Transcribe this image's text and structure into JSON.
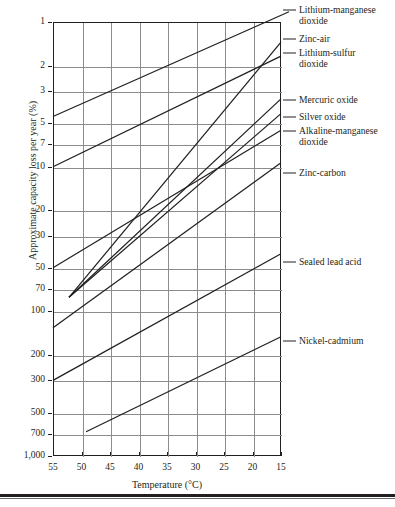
{
  "chart_data": {
    "type": "line",
    "title": "",
    "xlabel": "Temperature (°C)",
    "ylabel": "Approximate capacity loss per year (%)",
    "xticks": [
      55,
      50,
      45,
      40,
      35,
      30,
      25,
      20,
      15
    ],
    "xtick_labels": [
      "55",
      "50",
      "45",
      "40",
      "35",
      "30",
      "25",
      "20",
      "15"
    ],
    "xlim": [
      55,
      15
    ],
    "x_axis_reversed": true,
    "yticks": [
      1,
      2,
      3,
      5,
      7,
      10,
      20,
      30,
      50,
      70,
      100,
      200,
      300,
      500,
      700,
      1000
    ],
    "ytick_labels": [
      "1",
      "2",
      "3",
      "5",
      "7",
      "10",
      "20",
      "30",
      "50",
      "70",
      "100",
      "200",
      "300",
      "500",
      "700",
      "1,000"
    ],
    "ylim": [
      1,
      1000
    ],
    "y_scale": "log",
    "y_axis_inverted": true,
    "grid": true,
    "legend_position": "right-annotations",
    "series": [
      {
        "name": "Lithium-manganese dioxide",
        "label": "Lithium-manganese\ndioxide",
        "points": [
          [
            55,
            4.5
          ],
          [
            13.6,
            0.85
          ]
        ]
      },
      {
        "name": "Zinc-air",
        "label": "Zinc-air",
        "points": [
          [
            52.2,
            80
          ],
          [
            15,
            1.38
          ]
        ]
      },
      {
        "name": "Lithium-sulfur dioxide",
        "label": "Lithium-sulfur\ndioxide",
        "points": [
          [
            55,
            10
          ],
          [
            15,
            1.72
          ]
        ]
      },
      {
        "name": "Mercuric oxide",
        "label": "Mercuric oxide",
        "points": [
          [
            52.2,
            80
          ],
          [
            15,
            3.4
          ]
        ]
      },
      {
        "name": "Silver oxide",
        "label": "Silver oxide",
        "points": [
          [
            52.2,
            80
          ],
          [
            15,
            4.3
          ]
        ]
      },
      {
        "name": "Alkaline-manganese dioxide",
        "label": "Alkaline-manganese\ndioxide",
        "points": [
          [
            55,
            50
          ],
          [
            15,
            5.6
          ]
        ]
      },
      {
        "name": "Zinc-carbon",
        "label": "Zinc-carbon",
        "points": [
          [
            55,
            130
          ],
          [
            15,
            9.4
          ]
        ]
      },
      {
        "name": "Sealed lead acid",
        "label": "Sealed lead acid",
        "points": [
          [
            55,
            300
          ],
          [
            15,
            40
          ]
        ]
      },
      {
        "name": "Nickel-cadmium",
        "label": "Nickel-cadmium",
        "points": [
          [
            49.2,
            680
          ],
          [
            15,
            150
          ]
        ]
      }
    ],
    "annotations": [
      {
        "name": "Lithium-manganese dioxide",
        "text": "Lithium-manganese\ndioxide",
        "y": 10
      },
      {
        "name": "Zinc-air",
        "text": "Zinc-air",
        "y": 39
      },
      {
        "name": "Lithium-sulfur dioxide",
        "text": "Lithium-sulfur\ndioxide",
        "y": 53
      },
      {
        "name": "Mercuric oxide",
        "text": "Mercuric oxide",
        "y": 100
      },
      {
        "name": "Silver oxide",
        "text": "Silver oxide",
        "y": 117
      },
      {
        "name": "Alkaline-manganese dioxide",
        "text": "Alkaline-manganese\ndioxide",
        "y": 131
      },
      {
        "name": "Zinc-carbon",
        "text": "Zinc-carbon",
        "y": 173
      },
      {
        "name": "Sealed lead acid",
        "text": "Sealed lead acid",
        "y": 262
      },
      {
        "name": "Nickel-cadmium",
        "text": "Nickel-cadmium",
        "y": 341
      }
    ],
    "colors": {
      "line": "#231f20",
      "grid": "#8c8c8c",
      "axis": "#231f20",
      "text": "#231f20",
      "background": "#ffffff"
    }
  }
}
